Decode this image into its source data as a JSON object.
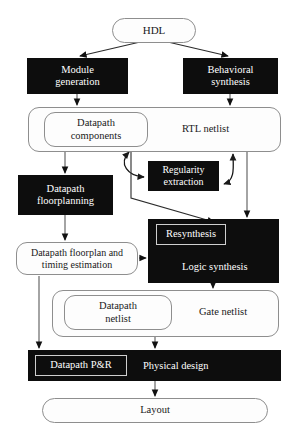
{
  "diagram": {
    "colors": {
      "dark_fill": "#0d0d0d",
      "dark_text": "#ffffff",
      "light_fill": "#fdfdfd",
      "light_text": "#1a1a1a",
      "outline": "#8e8e8e",
      "inner_outline": "#cfcfcf",
      "wire": "#595959"
    },
    "nodes": {
      "hdl": {
        "label": "HDL",
        "shape": "rounded-pill",
        "style": "light"
      },
      "module_generation": {
        "label": "Module\ngeneration",
        "line1": "Module",
        "line2": "generation",
        "shape": "rect",
        "style": "dark"
      },
      "behavioral_synthesis": {
        "label": "Behavioral\nsynthesis",
        "line1": "Behavioral",
        "line2": "synthesis",
        "shape": "rect",
        "style": "dark"
      },
      "rtl_netlist": {
        "label": "RTL netlist",
        "shape": "rounded-soft",
        "style": "light"
      },
      "datapath_components": {
        "line1": "Datapath",
        "line2": "components",
        "shape": "rounded-soft",
        "style": "light"
      },
      "regularity_extraction": {
        "line1": "Regularity",
        "line2": "extraction",
        "shape": "rect",
        "style": "dark"
      },
      "datapath_floorplanning": {
        "line1": "Datapath",
        "line2": "floorplanning",
        "shape": "rect",
        "style": "dark"
      },
      "datapath_floorplan_timing": {
        "line1": "Datapath floorplan and",
        "line2": "timing estimation",
        "shape": "rounded-soft",
        "style": "light"
      },
      "logic_synthesis": {
        "label": "Logic synthesis",
        "shape": "rect",
        "style": "dark"
      },
      "resynthesis": {
        "label": "Resynthesis",
        "shape": "rect",
        "style": "inner-on-dark"
      },
      "gate_netlist": {
        "label": "Gate netlist",
        "shape": "rounded-soft",
        "style": "light"
      },
      "datapath_netlist": {
        "line1": "Datapath",
        "line2": "netlist",
        "shape": "rounded-soft",
        "style": "light"
      },
      "physical_design": {
        "label": "Physical design",
        "shape": "rect",
        "style": "dark"
      },
      "datapath_pr": {
        "label": "Datapath P&R",
        "shape": "rect",
        "style": "inner-on-dark"
      },
      "layout": {
        "label": "Layout",
        "shape": "rounded-pill",
        "style": "light"
      }
    }
  }
}
